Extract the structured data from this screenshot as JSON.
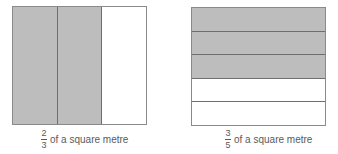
{
  "figures": [
    {
      "orientation": "vertical",
      "parts": 3,
      "shaded_parts": 2,
      "caption": {
        "numerator": "2",
        "denominator": "3",
        "text": "of a square metre"
      }
    },
    {
      "orientation": "horizontal",
      "parts": 5,
      "shaded_parts": 3,
      "caption": {
        "numerator": "3",
        "denominator": "5",
        "text": "of a square metre"
      }
    }
  ],
  "colors": {
    "shaded": "#bdbdbd",
    "unshaded": "#ffffff",
    "border": "#8a8a8a",
    "text": "#5a5a5a"
  }
}
